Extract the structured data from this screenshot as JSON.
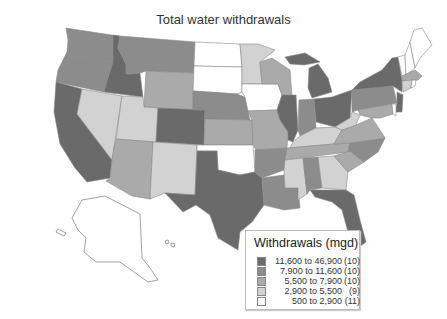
{
  "title": "Total water withdrawals",
  "legend": {
    "title": "Withdrawals (mgd)",
    "items": [
      {
        "range": "11,600 to 46,900",
        "count": "(10)",
        "color": "#6a6a6a"
      },
      {
        "range": "7,900 to 11,600",
        "count": "(10)",
        "color": "#8c8c8c"
      },
      {
        "range": "5,500 to 7,900",
        "count": "(10)",
        "color": "#aaaaaa"
      },
      {
        "range": "2,900 to 5,500",
        "count": "(9)",
        "color": "#d2d2d2"
      },
      {
        "range": "500 to 2,900",
        "count": "(11)",
        "color": "#ffffff"
      }
    ]
  },
  "map": {
    "unit": "million gallons per day (mgd)",
    "classes": {
      "class5": [
        "CA",
        "ID",
        "CO",
        "TX",
        "IL",
        "MI",
        "OH",
        "NY",
        "NJ",
        "FL"
      ],
      "class4": [
        "WA",
        "OR",
        "MT",
        "NE",
        "LA",
        "IN",
        "PA",
        "NC",
        "AL",
        "AR"
      ],
      "class3": [
        "WY",
        "KS",
        "AZ",
        "MO",
        "WI",
        "VA",
        "SC",
        "TN",
        "MA",
        "MD"
      ],
      "class2": [
        "NV",
        "UT",
        "NM",
        "MN",
        "KY",
        "WV",
        "MS",
        "GA",
        "CT"
      ],
      "class1": [
        "ND",
        "SD",
        "IA",
        "OK",
        "ME",
        "NH",
        "VT",
        "RI",
        "DE",
        "AK",
        "HI"
      ]
    }
  }
}
